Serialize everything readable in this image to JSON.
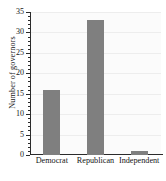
{
  "chart_data": {
    "type": "bar",
    "title": "",
    "xlabel": "",
    "ylabel": "Number of governors",
    "categories": [
      "Democrat",
      "Republican",
      "Independent"
    ],
    "values": [
      16,
      33,
      1
    ],
    "ylim": [
      0,
      35
    ],
    "ytick_step": 5,
    "yticks": [
      0,
      5,
      10,
      15,
      20,
      25,
      30,
      35
    ],
    "ytick_labels": [
      "0",
      "5",
      "10",
      "15",
      "20",
      "25",
      "30",
      "35"
    ],
    "minor_ticks": true,
    "grid": true,
    "legend": false,
    "bar_color": "#7f7f7f",
    "plot_background": "#fbfbfb",
    "axis_color": "#2b2b2b",
    "grid_color": "#ededed"
  }
}
